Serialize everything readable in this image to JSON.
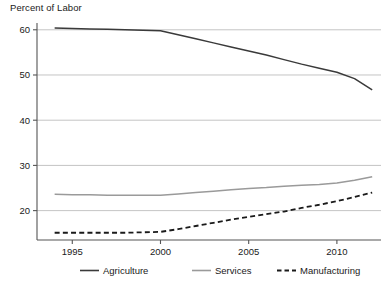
{
  "chart_data": {
    "type": "line",
    "title": "Percent of Labor",
    "xlabel": "",
    "ylabel": "Percent of Labor",
    "xlim": [
      1993,
      2012.5
    ],
    "ylim": [
      13.5,
      61.5
    ],
    "xticks": [
      1995,
      2000,
      2005,
      2010
    ],
    "xtick_labels": [
      "1995",
      "2000",
      "2005",
      "2010"
    ],
    "yticks": [
      20,
      30,
      40,
      50,
      60
    ],
    "ytick_labels": [
      "20",
      "30",
      "40",
      "50",
      "60"
    ],
    "grid": "horizontal",
    "legend_position": "bottom",
    "x": [
      1994,
      1995,
      1996,
      1997,
      1998,
      1999,
      2000,
      2001,
      2002,
      2003,
      2004,
      2005,
      2006,
      2007,
      2008,
      2009,
      2010,
      2011,
      2012
    ],
    "series": [
      {
        "name": "Agriculture",
        "style": "solid",
        "color": "#3a3a3a",
        "values": [
          60.4,
          60.3,
          60.2,
          60.1,
          60.0,
          59.9,
          59.8,
          58.9,
          58.0,
          57.1,
          56.2,
          55.3,
          54.4,
          53.4,
          52.4,
          51.5,
          50.6,
          49.2,
          46.7
        ]
      },
      {
        "name": "Services",
        "style": "solid",
        "color": "#9a9a9a",
        "values": [
          23.6,
          23.5,
          23.5,
          23.4,
          23.4,
          23.4,
          23.4,
          23.7,
          24.0,
          24.3,
          24.6,
          24.9,
          25.1,
          25.4,
          25.6,
          25.8,
          26.1,
          26.7,
          27.5
        ]
      },
      {
        "name": "Manufacturing",
        "style": "dashed",
        "color": "#1a1a1a",
        "values": [
          15.1,
          15.1,
          15.1,
          15.1,
          15.1,
          15.2,
          15.3,
          15.9,
          16.6,
          17.3,
          18.0,
          18.6,
          19.2,
          19.8,
          20.6,
          21.3,
          22.1,
          23.0,
          24.0
        ]
      }
    ],
    "legend": [
      {
        "label": "Agriculture",
        "style": "solid",
        "color": "#3a3a3a"
      },
      {
        "label": "Services",
        "style": "solid",
        "color": "#9a9a9a"
      },
      {
        "label": "Manufacturing",
        "style": "dashed",
        "color": "#1a1a1a"
      }
    ],
    "colors": {
      "axis": "#555555",
      "grid": "#bdbdbd",
      "text": "#1a1a1a",
      "background": "#ffffff"
    }
  }
}
